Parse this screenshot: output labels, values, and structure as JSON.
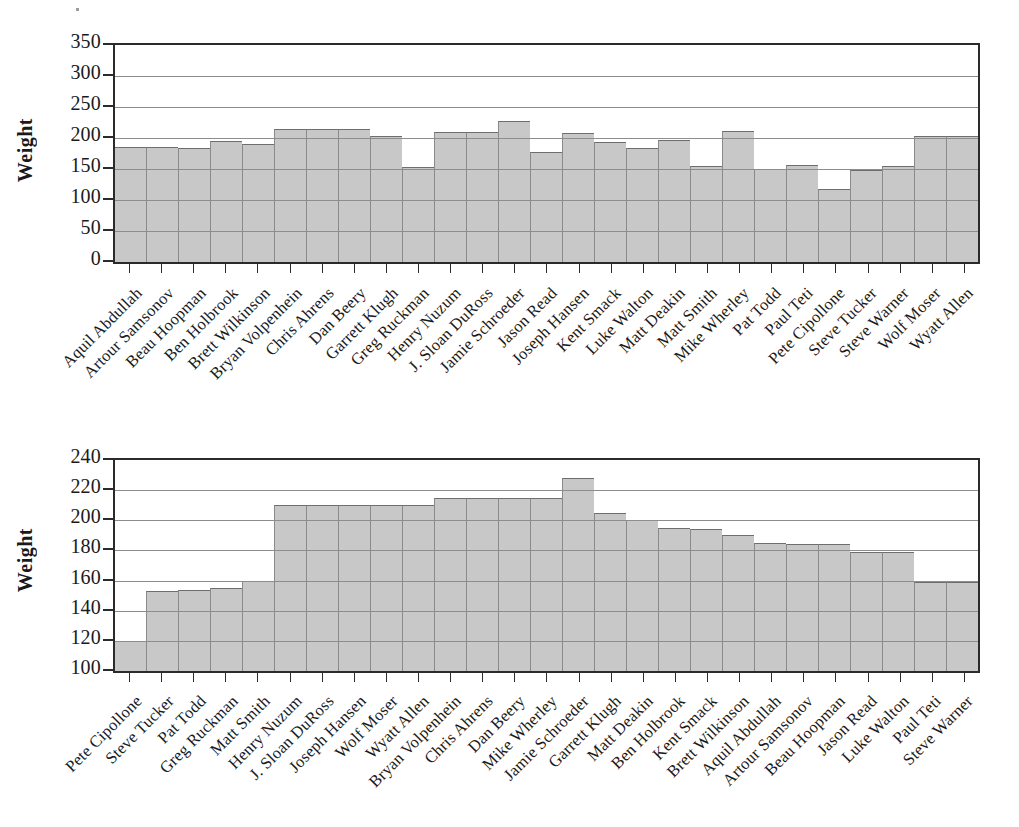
{
  "page": {
    "background": "#ffffff",
    "bar_fill": "#c8c8c8",
    "axis_color": "#2b2b2b",
    "grid_color": "#8d8d8d"
  },
  "chart_data": [
    {
      "id": "top",
      "type": "bar",
      "title": "",
      "xlabel": "",
      "ylabel": "Weight",
      "ylim": [
        0,
        350
      ],
      "yticks": [
        0,
        50,
        100,
        150,
        200,
        250,
        300,
        350
      ],
      "ytick_labels": [
        "0",
        "50",
        "100",
        "150",
        "200",
        "250",
        "300",
        "350"
      ],
      "gridlines": [
        50,
        100,
        150,
        200,
        250,
        300
      ],
      "grid": true,
      "legend": "none",
      "sort": "alphabetical-by-name",
      "categories": [
        "Aquil Abdullah",
        "Artour Samsonov",
        "Beau Hoopman",
        "Ben Holbrook",
        "Brett Wilkinson",
        "Bryan Volpenhein",
        "Chris Ahrens",
        "Dan Beery",
        "Garrett Klugh",
        "Greg Ruckman",
        "Henry Nuzum",
        "J. Sloan DuRoss",
        "Jamie Schroeder",
        "Jason Read",
        "Joseph Hansen",
        "Kent Smack",
        "Luke Walton",
        "Matt Deakin",
        "Matt Smith",
        "Mike Wherley",
        "Pat Todd",
        "Paul Teti",
        "Pete Cipollone",
        "Steve Tucker",
        "Steve Warner",
        "Wolf Moser",
        "Wyatt Allen"
      ],
      "values": [
        185,
        185,
        184,
        195,
        190,
        214,
        214,
        214,
        204,
        153,
        209,
        209,
        228,
        178,
        208,
        193,
        184,
        197,
        155,
        211,
        150,
        157,
        117,
        149,
        155,
        204,
        204
      ]
    },
    {
      "id": "bottom",
      "type": "bar",
      "title": "",
      "xlabel": "",
      "ylabel": "Weight",
      "ylim": [
        100,
        240
      ],
      "yticks": [
        100,
        120,
        140,
        160,
        180,
        200,
        220,
        240
      ],
      "ytick_labels": [
        "100",
        "120",
        "140",
        "160",
        "180",
        "200",
        "220",
        "240"
      ],
      "gridlines": [
        120,
        140,
        160,
        180,
        200,
        220
      ],
      "grid": true,
      "legend": "none",
      "sort": "ascending-by-weight",
      "categories": [
        "Pete Cipollone",
        "Steve Tucker",
        "Pat Todd",
        "Greg Ruckman",
        "Matt Smith",
        "Henry Nuzum",
        "J. Sloan DuRoss",
        "Joseph Hansen",
        "Wolf Moser",
        "Wyatt Allen",
        "Bryan Volpenhein",
        "Chris Ahrens",
        "Dan Beery",
        "Mike Wherley",
        "Jamie Schroeder",
        "Garrett Klugh",
        "Matt Deakin",
        "Ben Holbrook",
        "Kent Smack",
        "Brett Wilkinson",
        "Aquil Abdullah",
        "Artour Samsonov",
        "Beau Hoopman",
        "Jason Read",
        "Luke Walton",
        "Paul Teti",
        "Steve Warner"
      ],
      "values": [
        120,
        153,
        154,
        155,
        160,
        210,
        210,
        210,
        210,
        210,
        215,
        215,
        215,
        215,
        228,
        205,
        200,
        195,
        194,
        190,
        185,
        184,
        184,
        179,
        179,
        159,
        159
      ]
    }
  ]
}
